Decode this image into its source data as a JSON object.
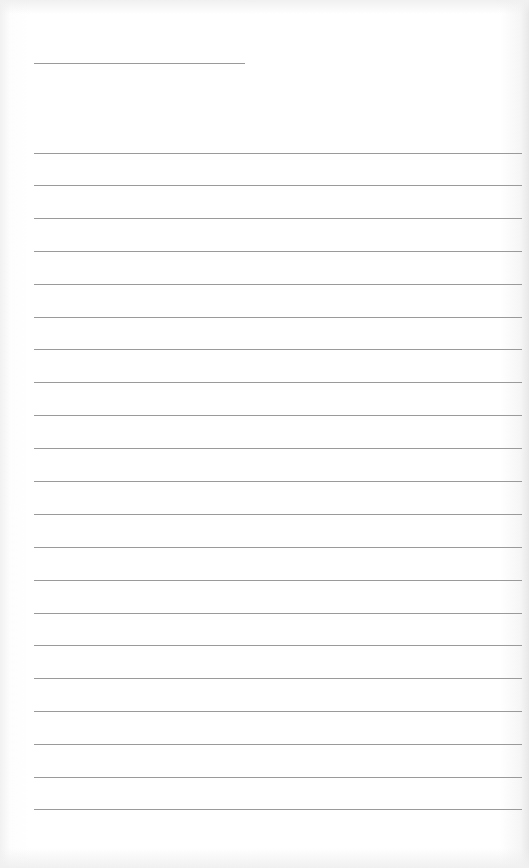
{
  "page": {
    "type": "lined-notepaper",
    "background_color": "#ffffff",
    "rule_color": "#9a9a9a"
  },
  "header_rule": {
    "x": 34,
    "y": 63,
    "width": 211
  },
  "rules": {
    "x": 34,
    "right": 522,
    "y_positions": [
      153,
      185,
      218,
      251,
      284,
      317,
      349,
      382,
      415,
      448,
      481,
      514,
      547,
      580,
      613,
      645,
      678,
      711,
      744,
      777,
      809
    ]
  }
}
